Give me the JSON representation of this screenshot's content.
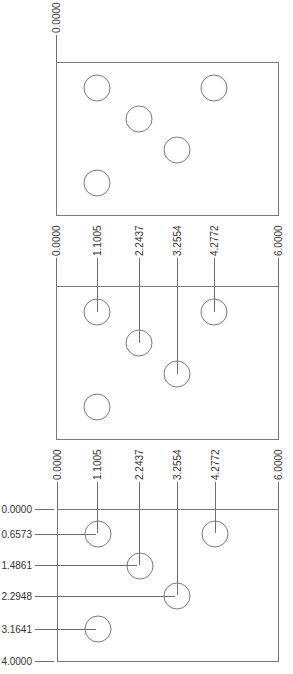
{
  "drawing": {
    "panels": [
      {
        "id": "step-1",
        "description": "Plate with holes, origin datum only",
        "x_labels": [
          "0.0000"
        ],
        "y_labels": []
      },
      {
        "id": "step-2",
        "description": "Plate with holes, horizontal ordinate dimensions",
        "x_labels": [
          "0.0000",
          "1.1005",
          "2.2437",
          "3.2554",
          "4.2772",
          "6.0000"
        ],
        "y_labels": []
      },
      {
        "id": "step-3",
        "description": "Plate with holes, horizontal and vertical ordinate dimensions",
        "x_labels": [
          "0.0000",
          "1.1005",
          "2.2437",
          "3.2554",
          "4.2772",
          "6.0000"
        ],
        "y_labels": [
          "0.0000",
          "0.6573",
          "1.4861",
          "2.2948",
          "3.1641",
          "4.0000"
        ]
      }
    ],
    "plate": {
      "width": "6.0000",
      "height": "4.0000"
    },
    "holes": [
      {
        "x": "1.1005",
        "y": "0.6573"
      },
      {
        "x": "4.2772",
        "y": "0.6573"
      },
      {
        "x": "2.2437",
        "y": "1.4861"
      },
      {
        "x": "3.2554",
        "y": "2.2948"
      },
      {
        "x": "1.1005",
        "y": "3.1641"
      }
    ],
    "colors": {
      "line": "#7a7a7a",
      "text": "#333333"
    }
  },
  "labels": {
    "p1": {
      "x0": "0.0000"
    },
    "p2": {
      "x0": "0.0000",
      "x1": "1.1005",
      "x2": "2.2437",
      "x3": "3.2554",
      "x4": "4.2772",
      "x5": "6.0000"
    },
    "p3": {
      "x0": "0.0000",
      "x1": "1.1005",
      "x2": "2.2437",
      "x3": "3.2554",
      "x4": "4.2772",
      "x5": "6.0000",
      "y0": "0.0000",
      "y1": "0.6573",
      "y2": "1.4861",
      "y3": "2.2948",
      "y4": "3.1641",
      "y5": "4.0000"
    }
  }
}
